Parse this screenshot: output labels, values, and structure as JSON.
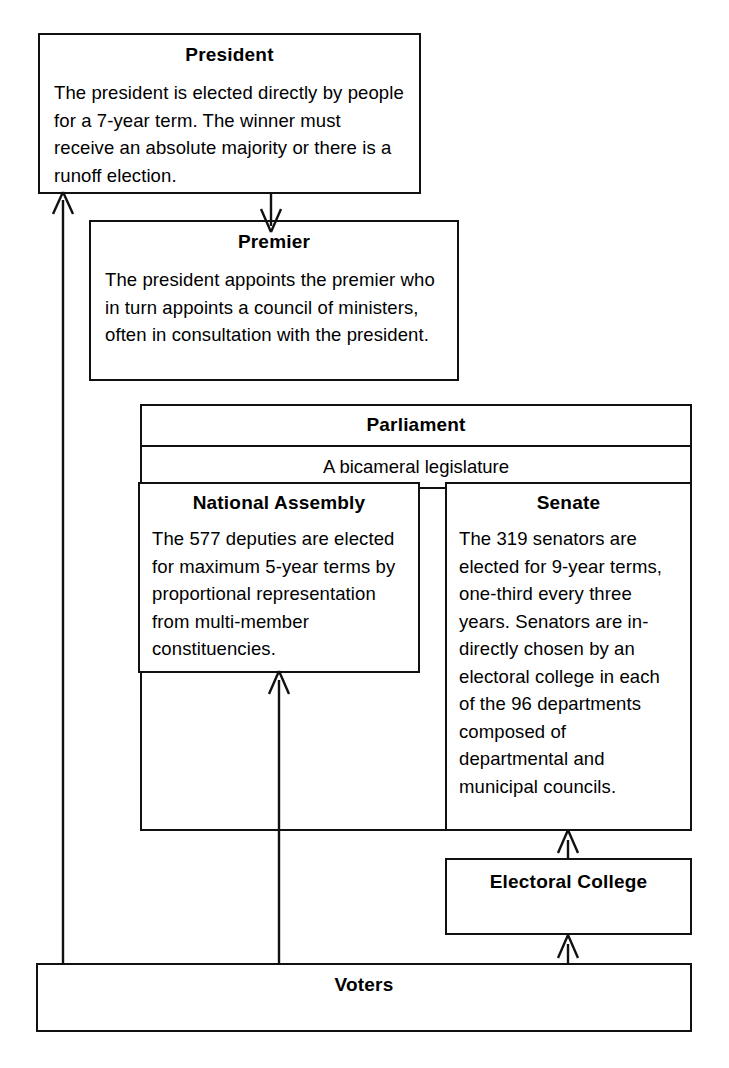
{
  "diagram": {
    "line_color": "#111111",
    "background": "#ffffff"
  },
  "nodes": {
    "president": {
      "title": "President",
      "body": "The president is elected directly by people for a 7-year term. The winner must receive an absolute majority or there is a runoff election."
    },
    "premier": {
      "title": "Premier",
      "body": "The president appoints the premier who in turn appoints a council of ministers, often in consultation with the president."
    },
    "parliament": {
      "title": "Parliament",
      "subtitle": "A bicameral legislature"
    },
    "national_assembly": {
      "title": "National Assembly",
      "body": "The 577 deputies are elected for maximum 5-year terms by proportional representation from multi-member constituencies."
    },
    "senate": {
      "title": "Senate",
      "body": "The 319 senators are elected for 9-year terms, one-third every three years. Senators are in-directly chosen by an electoral college in each of the 96 departments composed of departmental and municipal councils."
    },
    "electoral_college": {
      "title": "Electoral College"
    },
    "voters": {
      "title": "Voters"
    }
  },
  "facts": {
    "president_term_years": 7,
    "deputies_count": 577,
    "national_assembly_term_years": 5,
    "senators_count": 319,
    "senate_term_years": 9,
    "senate_renewal_fraction": "one-third",
    "senate_renewal_years": 3,
    "departments_count": 96
  },
  "edges": [
    {
      "from": "voters",
      "to": "president",
      "label": "elects directly"
    },
    {
      "from": "president",
      "to": "premier",
      "label": "appoints"
    },
    {
      "from": "voters",
      "to": "national_assembly",
      "label": "elects"
    },
    {
      "from": "voters",
      "to": "electoral_college",
      "label": "elects"
    },
    {
      "from": "electoral_college",
      "to": "senate",
      "label": "chooses"
    }
  ]
}
